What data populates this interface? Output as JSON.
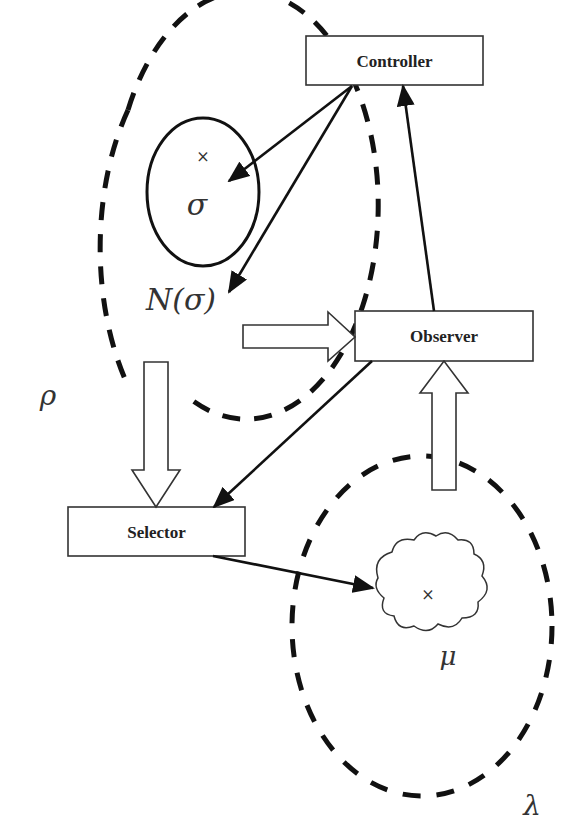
{
  "diagram": {
    "boxes": {
      "controller": "Controller",
      "observer": "Observer",
      "selector": "Selector"
    },
    "symbols": {
      "rho": "ρ",
      "sigma": "σ",
      "neighborhood": "N(σ)",
      "mu": "μ",
      "lambda": "λ",
      "marker": "×"
    },
    "edges": [
      {
        "from": "Controller",
        "to": "σ",
        "style": "solid-arrow"
      },
      {
        "from": "Controller",
        "to": "N(σ)",
        "style": "solid-arrow"
      },
      {
        "from": "Observer",
        "to": "Controller",
        "style": "solid-arrow"
      },
      {
        "from": "Observer",
        "to": "Selector",
        "style": "solid-arrow"
      },
      {
        "from": "Selector",
        "to": "μ",
        "style": "solid-arrow"
      },
      {
        "from": "ρ",
        "to": "Observer",
        "style": "hollow-block-arrow"
      },
      {
        "from": "ρ",
        "to": "Selector",
        "style": "hollow-block-arrow"
      },
      {
        "from": "λ",
        "to": "Observer",
        "style": "hollow-block-arrow"
      }
    ]
  }
}
